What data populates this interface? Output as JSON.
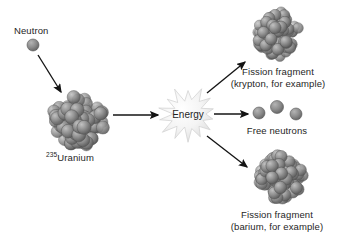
{
  "figure": {
    "type": "diagram",
    "background_color": "#ffffff",
    "text_color": "#262626",
    "sphere_color": "#8a8a8a",
    "sphere_dark": "#5f5f5f",
    "sphere_light": "#b9b9b9",
    "arrow_color": "#141414",
    "burst_color": "#f2f2f2",
    "burst_edge": "#cfcfcf"
  },
  "labels": {
    "neutron": "Neutron",
    "uranium_mass_number": "235",
    "uranium_name": "Uranium",
    "energy": "Energy",
    "free_neutrons": "Free neutrons",
    "fragment_top_line1": "Fission fragment",
    "fragment_top_line2": "(krypton, for example)",
    "fragment_bottom_line1": "Fission fragment",
    "fragment_bottom_line2": "(barium, for example)"
  },
  "objects": {
    "incoming_neutron": {
      "cx": 33,
      "cy": 45,
      "r": 6
    },
    "uranium_nucleus": {
      "cx": 79,
      "cy": 120,
      "r": 31,
      "nucleon_count": 96
    },
    "energy_burst": {
      "cx": 188,
      "cy": 114,
      "r_outer": 26,
      "r_inner": 15,
      "points": 14
    },
    "krypton_fragment": {
      "cx": 277,
      "cy": 35,
      "r": 27,
      "nucleon_count": 72
    },
    "barium_fragment": {
      "cx": 280,
      "cy": 177,
      "r": 28,
      "nucleon_count": 78
    },
    "free_neutrons": [
      {
        "cx": 259,
        "cy": 113,
        "r": 6
      },
      {
        "cx": 277,
        "cy": 107,
        "r": 6.5
      },
      {
        "cx": 296,
        "cy": 114,
        "r": 6
      }
    ]
  },
  "arrows": [
    {
      "name": "neutron-to-uranium",
      "x1": 38,
      "y1": 55,
      "x2": 61,
      "y2": 92
    },
    {
      "name": "uranium-to-energy",
      "x1": 113,
      "y1": 115,
      "x2": 158,
      "y2": 115
    },
    {
      "name": "energy-to-krypton",
      "x1": 207,
      "y1": 93,
      "x2": 245,
      "y2": 62
    },
    {
      "name": "energy-to-free-neutrons",
      "x1": 214,
      "y1": 114,
      "x2": 248,
      "y2": 114
    },
    {
      "name": "energy-to-barium",
      "x1": 207,
      "y1": 136,
      "x2": 247,
      "y2": 167
    }
  ],
  "label_positions": {
    "neutron": {
      "x": 14,
      "y": 25
    },
    "uranium": {
      "x": 46,
      "y": 152
    },
    "energy": {
      "x": 188,
      "y": 114
    },
    "free_neutrons": {
      "x": 277,
      "y": 125
    },
    "fragment_top": {
      "x": 278,
      "y": 66
    },
    "fragment_bottom": {
      "x": 277,
      "y": 209
    }
  }
}
